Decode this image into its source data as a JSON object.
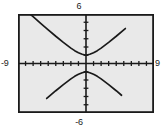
{
  "screen": {
    "name": "graphing-calculator-plot",
    "background_color": "#e9e9e9",
    "frame_color": "#1a1a1a",
    "curve_color": "#1a1a1a",
    "label_color": "#1a1a1a"
  },
  "labels": {
    "y_max": "6",
    "y_min": "-6",
    "x_min": "-9",
    "x_max": "9"
  },
  "chart_data": {
    "type": "line",
    "title": "",
    "xlabel": "",
    "ylabel": "",
    "xlim": [
      -9,
      9
    ],
    "ylim": [
      -6,
      6
    ],
    "grid": false,
    "x_tick_labels": [
      "-9",
      "9"
    ],
    "y_tick_labels": [
      "6",
      "-6"
    ],
    "x_tick_step": 1,
    "y_tick_step": 1,
    "axes_visible": true,
    "series": [
      {
        "name": "upper-branch",
        "x": [
          -7.9,
          -7.0,
          -6.0,
          -5.0,
          -4.0,
          -3.0,
          -2.0,
          -1.5,
          -1.0,
          -0.5,
          0.0,
          0.5,
          1.0,
          1.5,
          2.0,
          3.0,
          4.0,
          5.0,
          5.2
        ],
        "y": [
          6.37,
          5.67,
          4.87,
          4.08,
          3.3,
          2.56,
          1.86,
          1.56,
          1.31,
          1.12,
          1.0,
          1.12,
          1.31,
          1.56,
          1.86,
          2.56,
          3.3,
          4.08,
          4.24
        ]
      },
      {
        "name": "lower-branch",
        "x": [
          -5.2,
          -5.0,
          -4.0,
          -3.0,
          -2.0,
          -1.5,
          -1.0,
          -0.5,
          0.0,
          0.5,
          1.0,
          1.5,
          2.0,
          3.0,
          4.0,
          4.7
        ],
        "y": [
          -4.24,
          -4.08,
          -3.3,
          -2.56,
          -1.86,
          -1.56,
          -1.31,
          -1.12,
          -1.0,
          -1.12,
          -1.31,
          -1.56,
          -1.86,
          -2.56,
          -3.3,
          -3.85
        ]
      }
    ]
  }
}
